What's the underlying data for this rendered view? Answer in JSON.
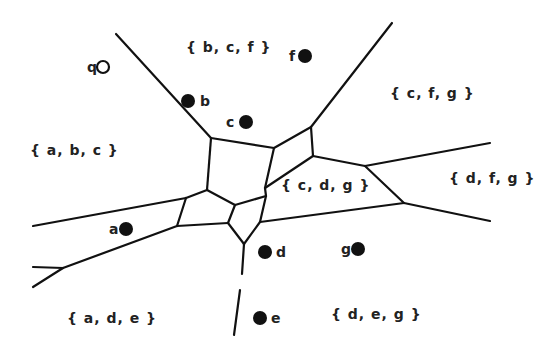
{
  "diagram": {
    "colors": {
      "line": "#111111",
      "text": "#222222",
      "background": "#ffffff"
    },
    "sites": [
      {
        "id": "q",
        "label": "q",
        "kind": "query"
      },
      {
        "id": "b",
        "label": "b",
        "kind": "site"
      },
      {
        "id": "c",
        "label": "c",
        "kind": "site"
      },
      {
        "id": "f",
        "label": "f",
        "kind": "site"
      },
      {
        "id": "a",
        "label": "a",
        "kind": "site"
      },
      {
        "id": "d",
        "label": "d",
        "kind": "site"
      },
      {
        "id": "g",
        "label": "g",
        "kind": "site"
      },
      {
        "id": "e",
        "label": "e",
        "kind": "site"
      }
    ],
    "regions": [
      {
        "id": "bcf",
        "label": "{ b, c, f }"
      },
      {
        "id": "cfg",
        "label": "{ c, f, g }"
      },
      {
        "id": "abc",
        "label": "{ a, b, c }"
      },
      {
        "id": "cdg",
        "label": "{ c, d, g }"
      },
      {
        "id": "dfg",
        "label": "{ d, f, g }"
      },
      {
        "id": "ade",
        "label": "{ a, d, e }"
      },
      {
        "id": "deg",
        "label": "{ d, e, g }"
      }
    ]
  }
}
